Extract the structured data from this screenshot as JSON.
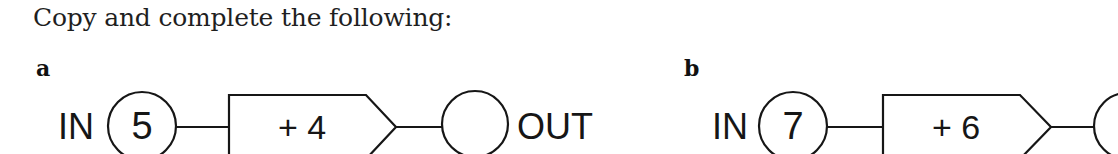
{
  "title": "Copy and complete the following:",
  "parts": [
    {
      "label": "a",
      "in_label": "IN",
      "input_value": "5",
      "operation": "+ 4",
      "output_value": "",
      "out_label": "OUT"
    },
    {
      "label": "b",
      "in_label": "IN",
      "input_value": "7",
      "operation": "+ 6",
      "output_value": ""
    }
  ],
  "colors": {
    "ink": "#161616",
    "background": "#ffffff"
  }
}
